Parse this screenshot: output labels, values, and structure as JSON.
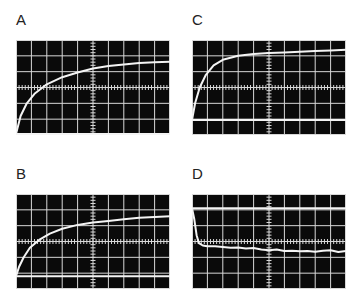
{
  "figure": {
    "panels": [
      {
        "id": "A",
        "label": "A",
        "position": {
          "label_x": 16,
          "label_y": 12,
          "x": 16,
          "y": 40,
          "w": 154,
          "h": 95
        },
        "baseline_div": 6.0,
        "trace": "rise",
        "trace_points": [
          [
            0,
            6.0
          ],
          [
            0.3,
            4.8
          ],
          [
            0.7,
            4.0
          ],
          [
            1.2,
            3.4
          ],
          [
            2,
            2.8
          ],
          [
            3,
            2.35
          ],
          [
            4,
            2.05
          ],
          [
            5,
            1.8
          ],
          [
            6,
            1.65
          ],
          [
            7,
            1.55
          ],
          [
            8,
            1.45
          ],
          [
            9,
            1.4
          ],
          [
            10,
            1.38
          ]
        ]
      },
      {
        "id": "C",
        "label": "C",
        "position": {
          "label_x": 192,
          "label_y": 12,
          "x": 192,
          "y": 40,
          "w": 154,
          "h": 95
        },
        "baseline_div": 5.05,
        "trace": "fast-rise",
        "trace_points": [
          [
            0,
            5.05
          ],
          [
            0.2,
            4.0
          ],
          [
            0.5,
            3.0
          ],
          [
            0.9,
            2.2
          ],
          [
            1.4,
            1.6
          ],
          [
            2,
            1.25
          ],
          [
            3,
            1.0
          ],
          [
            4,
            0.88
          ],
          [
            5,
            0.82
          ],
          [
            6,
            0.78
          ],
          [
            7,
            0.74
          ],
          [
            8,
            0.7
          ],
          [
            9,
            0.66
          ],
          [
            10,
            0.62
          ]
        ]
      },
      {
        "id": "B",
        "label": "B",
        "position": {
          "label_x": 16,
          "label_y": 166,
          "x": 16,
          "y": 194,
          "w": 154,
          "h": 95
        },
        "baseline_div": 5.2,
        "trace": "rise",
        "trace_points": [
          [
            0,
            5.2
          ],
          [
            0.2,
            4.6
          ],
          [
            0.5,
            4.0
          ],
          [
            0.9,
            3.4
          ],
          [
            1.5,
            2.9
          ],
          [
            2.2,
            2.5
          ],
          [
            3,
            2.2
          ],
          [
            4,
            1.95
          ],
          [
            5,
            1.8
          ],
          [
            6,
            1.7
          ],
          [
            7,
            1.6
          ],
          [
            8,
            1.5
          ],
          [
            9,
            1.45
          ],
          [
            10,
            1.4
          ]
        ]
      },
      {
        "id": "D",
        "label": "D",
        "position": {
          "label_x": 192,
          "label_y": 166,
          "x": 192,
          "y": 194,
          "w": 154,
          "h": 95
        },
        "baseline_div": 0.9,
        "trace": "drop-noisy",
        "trace_points": [
          [
            0,
            0.9
          ],
          [
            0.15,
            1.6
          ],
          [
            0.3,
            2.6
          ],
          [
            0.45,
            3.1
          ],
          [
            0.7,
            3.25
          ],
          [
            1,
            3.3
          ],
          [
            1.5,
            3.3
          ],
          [
            2,
            3.35
          ],
          [
            2.5,
            3.4
          ],
          [
            3,
            3.38
          ],
          [
            3.5,
            3.45
          ],
          [
            4,
            3.42
          ],
          [
            4.5,
            3.5
          ],
          [
            5,
            3.55
          ],
          [
            5.5,
            3.5
          ],
          [
            6,
            3.6
          ],
          [
            6.5,
            3.58
          ],
          [
            7,
            3.62
          ],
          [
            7.5,
            3.6
          ],
          [
            8,
            3.65
          ],
          [
            8.5,
            3.58
          ],
          [
            9,
            3.55
          ],
          [
            9.5,
            3.66
          ],
          [
            10,
            3.6
          ]
        ]
      }
    ],
    "grid": {
      "columns": 10,
      "rows": 6,
      "color": "#d8d8d8",
      "screen_color": "#0a0a0a",
      "trace_color": "#f4f4f4",
      "label_color": "#222222"
    }
  }
}
